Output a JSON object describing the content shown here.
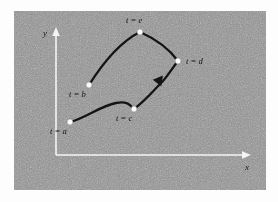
{
  "figure": {
    "name": "parametric-curve-diagram",
    "panel": {
      "background_color": "#8e8e8e",
      "page_color": "#ffffff",
      "noise": true
    }
  },
  "axes": {
    "x_label": "x",
    "y_label": "y",
    "color": "#f4f4f4",
    "origin": {
      "x": 56,
      "y": 155
    },
    "x_end": {
      "x": 248,
      "y": 155
    },
    "y_end": {
      "x": 56,
      "y": 30
    }
  },
  "curve": {
    "color": "#141414",
    "direction_arrow": {
      "x": 157,
      "y": 83,
      "angle": -52
    },
    "path": "M 70 122 C 86 118, 100 106, 116 103 C 126 101, 130 104, 134 109 C 146 100, 152 92, 163 81 C 170 73, 173 67, 178 61 C 170 50, 158 40, 140 32 C 124 40, 106 58, 89 85"
  },
  "nodes": [
    {
      "id": "a",
      "label": "t = a",
      "x": 70,
      "y": 122,
      "label_x": 50,
      "label_y": 134
    },
    {
      "id": "b",
      "label": "t = b",
      "x": 89,
      "y": 85,
      "label_x": 69,
      "label_y": 97
    },
    {
      "id": "c",
      "label": "t = c",
      "x": 134,
      "y": 109,
      "label_x": 116,
      "label_y": 121
    },
    {
      "id": "d",
      "label": "t = d",
      "x": 178,
      "y": 61,
      "label_x": 186,
      "label_y": 64
    },
    {
      "id": "e",
      "label": "t = e",
      "x": 140,
      "y": 32,
      "label_x": 126,
      "label_y": 23
    }
  ]
}
